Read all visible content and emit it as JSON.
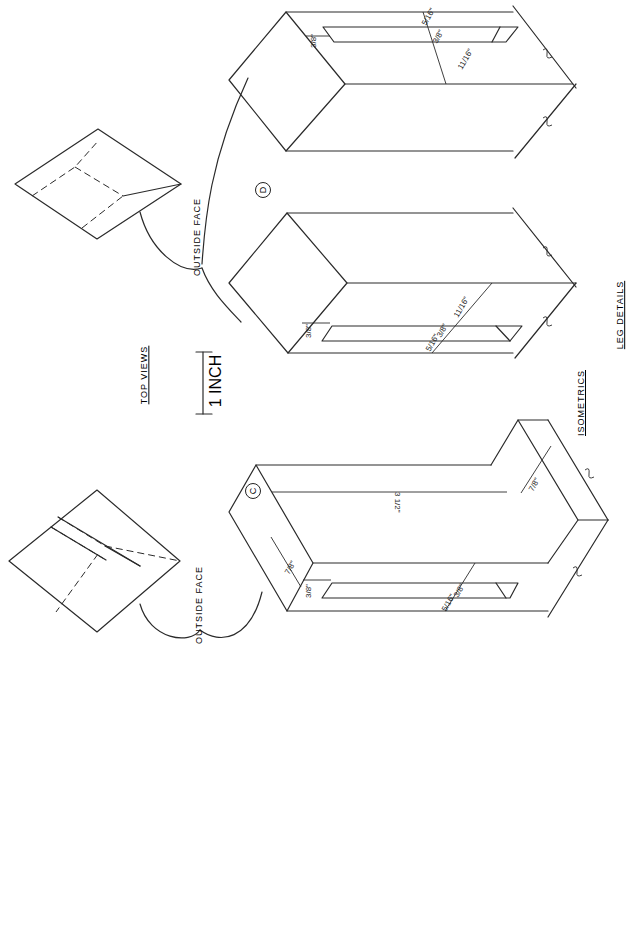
{
  "drawing": {
    "orientation": "rotated 90 degrees counter-clockwise",
    "labels": {
      "top_views": "TOP VIEWS",
      "scale": "1 INCH",
      "isometrics": "ISOMETRICS",
      "leg_details": "LEG DETAILS",
      "outside_face_upper": "OUTSIDE FACE",
      "outside_face_lower": "OUTSIDE FACE"
    },
    "markers": {
      "detail_c": "C",
      "detail_d": "D"
    },
    "dimensions": {
      "d_upper": {
        "a": "3/8\"",
        "b": "3/8\"",
        "c": "5/16\"",
        "d": "11/16\""
      },
      "d_lower": {
        "a": "3/8\"",
        "b": "5/16\"",
        "c": "3/8\"",
        "d": "11/16\""
      },
      "c": {
        "a": "7/8\"",
        "b": "3/8\"",
        "c": "5/16\"",
        "d": "3/8\"",
        "e": "3 1/2\"",
        "f": "7/8\""
      }
    }
  }
}
